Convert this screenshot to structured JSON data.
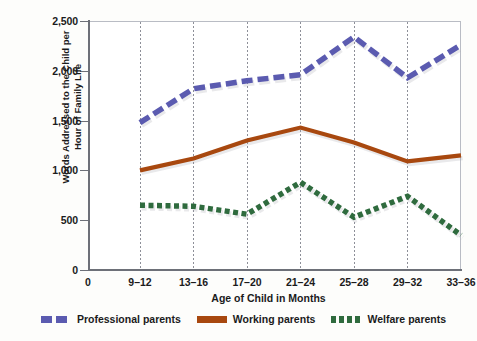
{
  "chart_data": {
    "type": "line",
    "title": "",
    "xlabel": "Age of Child in Months",
    "ylabel": "Words Addressed to the Child per Hour of Family Life",
    "ylabel_line1": "Words Addressed to the Child per",
    "ylabel_line2": "Hour of Family Life",
    "categories": [
      "9–12",
      "13–16",
      "17–20",
      "21–24",
      "25–28",
      "29–32",
      "33–36"
    ],
    "x_origin_label": "0",
    "ytick_labels": [
      "0",
      "500",
      "1,000",
      "1,500",
      "2,000",
      "2,500"
    ],
    "ytick_values": [
      0,
      500,
      1000,
      1500,
      2000,
      2500
    ],
    "ylim": [
      0,
      2500
    ],
    "grid": "vertical-dotted",
    "legend_position": "bottom",
    "series": [
      {
        "name": "Professional parents",
        "color": "#5b5bb0",
        "style": "dashed",
        "values": [
          1480,
          1820,
          1900,
          1960,
          2340,
          1930,
          2260
        ]
      },
      {
        "name": "Working parents",
        "color": "#a8480f",
        "style": "solid",
        "values": [
          1000,
          1120,
          1300,
          1430,
          1280,
          1090,
          1150
        ]
      },
      {
        "name": "Welfare parents",
        "color": "#2f6b3e",
        "style": "dotted",
        "values": [
          650,
          640,
          560,
          880,
          530,
          740,
          350
        ]
      }
    ]
  },
  "legend": {
    "items": [
      {
        "label": "Professional parents",
        "icon": "dashed-line-swatch"
      },
      {
        "label": "Working parents",
        "icon": "solid-line-swatch"
      },
      {
        "label": "Welfare parents",
        "icon": "dotted-line-swatch"
      }
    ]
  }
}
